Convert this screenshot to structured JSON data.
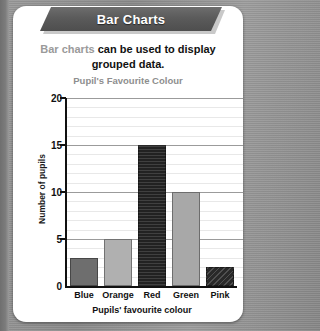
{
  "banner": {
    "title": "Bar Charts"
  },
  "intro": {
    "lead": "Bar charts",
    "rest": " can be used to display grouped data."
  },
  "colors": {
    "banner_dark": "#5b5b5b",
    "card_bg": "#ffffff",
    "backdrop": "#8c8c8c",
    "muted_text": "#9a9a9a",
    "axis": "#111111",
    "gridline_major": "#9b9b9b",
    "gridline_minor": "#e8e8e8"
  },
  "chart_data": {
    "type": "bar",
    "title": "Pupil's Favourite Colour",
    "xlabel": "Pupils' favourite colour",
    "ylabel": "Number of pupils",
    "categories": [
      "Blue",
      "Orange",
      "Red",
      "Green",
      "Pink"
    ],
    "values": [
      3,
      5,
      15,
      10,
      2
    ],
    "bar_colors": [
      "#6e6e6e",
      "#b0b0b0",
      "#2a2a2a",
      "#a8a8a8",
      "#333333"
    ],
    "bar_textures": [
      "plain",
      "plain",
      "stripe",
      "plain",
      "hatch"
    ],
    "ylim": [
      0,
      20
    ],
    "yticks": [
      0,
      5,
      10,
      15,
      20
    ],
    "ytick_labels": [
      "0",
      "5",
      "10",
      "15",
      "20"
    ],
    "minor_gridline_step": 1,
    "grid": true,
    "legend": false
  }
}
